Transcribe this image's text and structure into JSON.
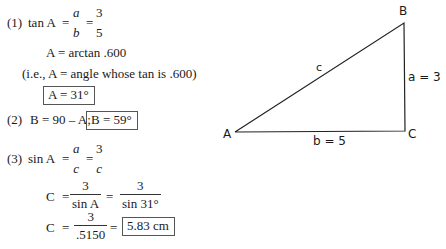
{
  "solution": {
    "step1": {
      "number": "(1)",
      "lhs": "tan A",
      "eq1": "=",
      "frac1": {
        "num": "a",
        "den": "b"
      },
      "eq2": "=",
      "frac2": {
        "num": "3",
        "den": "5"
      },
      "line2": "A = arctan .600",
      "line3": "(i.e., A = angle whose tan is .600)",
      "result": "A = 31°"
    },
    "step2": {
      "number": "(2)",
      "text": "B = 90 – A;",
      "result": "B = 59°"
    },
    "step3": {
      "number": "(3)",
      "lhs": "sin A",
      "eq1": "=",
      "frac1": {
        "num": "a",
        "den": "c"
      },
      "eq2": "=",
      "frac2": {
        "num": "3",
        "den": "c"
      },
      "line2": {
        "lhs": "C",
        "eq1": "=",
        "frac1": {
          "num": "3",
          "den": "sin A"
        },
        "eq2": "=",
        "frac2": {
          "num": "3",
          "den": "sin 31°"
        }
      },
      "line3": {
        "lhs": "C",
        "eq1": "=",
        "frac1": {
          "num": "3",
          "den": ".5150"
        },
        "eq2": "=",
        "result": "5.83 cm"
      }
    }
  },
  "diagram": {
    "vertices": {
      "A": "A",
      "B": "B",
      "C": "C"
    },
    "sides": {
      "a": "a = 3",
      "b": "b = 5",
      "c": "c"
    },
    "line_color": "#222222"
  }
}
